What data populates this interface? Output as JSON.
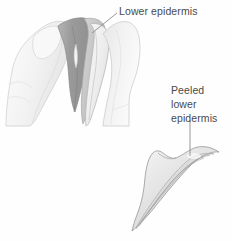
{
  "figure": {
    "kind": "botany-leaf-peel-illustration",
    "background_color": "#fefefe",
    "width": 232,
    "height": 241
  },
  "labels": {
    "lower_epidermis": {
      "text": "Lower epidermis",
      "color": "#4a4a4a"
    },
    "peeled_lower_epidermis": {
      "line1": "Peeled",
      "line2": "lower",
      "line3": "epidermis",
      "color": "#4a4a4a"
    }
  },
  "leader_lines": {
    "lower_epidermis": {
      "name": "diagonal-leader-line",
      "color": "#8c8c8c",
      "from_x": 117,
      "from_y": 13,
      "to_x": 92,
      "to_y": 33
    },
    "peeled_lower_epidermis": {
      "name": "vertical-leader-line",
      "color": "#8c8c8c",
      "from_x": 190,
      "from_y": 120,
      "to_x": 190,
      "to_y": 156
    }
  },
  "illustration_parts": {
    "left_thumb": {
      "name": "left-thumb",
      "fill": "#f3f3f3",
      "stroke": "#d2d2d2"
    },
    "left_thumbnail": {
      "name": "left-thumbnail",
      "fill": "#f7f7f7",
      "stroke": "#d9d9d9"
    },
    "right_thumb": {
      "name": "right-thumb",
      "fill": "#f1f1f1",
      "stroke": "#cfcfcf"
    },
    "leaf_dark_layer": {
      "name": "leaf-dark-inner-layer",
      "fill": "#9a9a9a",
      "stroke": "#8a8a8a"
    },
    "leaf_mid_layer": {
      "name": "leaf-mid-layer",
      "fill": "#c9c9c9",
      "stroke": "#a8a8a8"
    },
    "leaf_light_flap": {
      "name": "leaf-light-peeled-flap",
      "fill": "#ebebeb",
      "stroke": "#b4b4b4"
    },
    "peeled_strip": {
      "name": "peeled-epidermis-strip",
      "fill": "#e4e4e4",
      "stroke": "#9e9e9e"
    },
    "peeled_strip_inner": {
      "name": "peeled-epidermis-inner-fold",
      "fill": "#d6d6d6",
      "stroke": "#9a9a9a"
    }
  }
}
